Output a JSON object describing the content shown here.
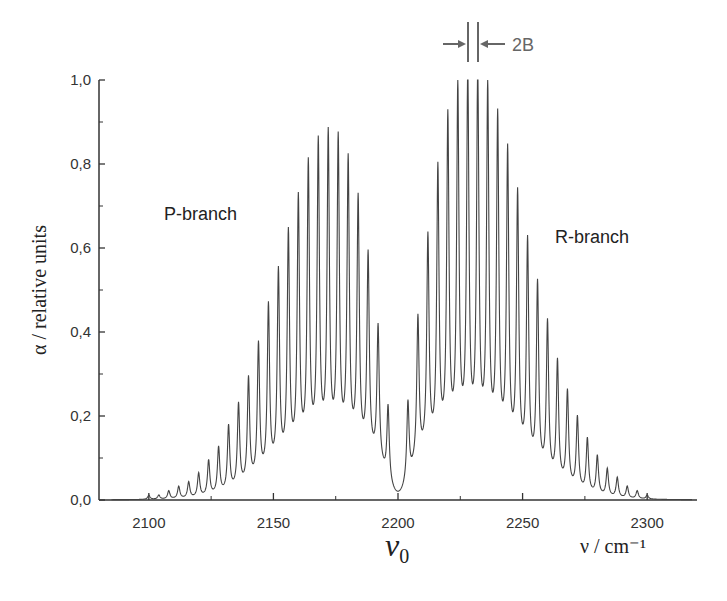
{
  "chart_data": {
    "type": "line",
    "title": "",
    "xlabel": "ν / cm⁻¹",
    "ylabel": "α / relative units",
    "xlim": [
      2080,
      2320
    ],
    "ylim": [
      0,
      1.0
    ],
    "x_ticks": [
      2100,
      2150,
      2200,
      2250,
      2300
    ],
    "x_tick_labels": [
      "2100",
      "2150",
      "2200",
      "2250",
      "2300"
    ],
    "y_ticks": [
      0.0,
      0.2,
      0.4,
      0.6,
      0.8,
      1.0
    ],
    "y_tick_labels": [
      "0,0",
      "0,2",
      "0,4",
      "0,6",
      "0,8",
      "1,0"
    ],
    "grid": false,
    "legend": null,
    "annotations": {
      "p_branch": "P-branch",
      "r_branch": "R-branch",
      "spacing_label": "2B",
      "band_origin": "ν",
      "band_origin_sub": "0"
    },
    "band_origin_cm": 2200,
    "line_spacing_cm": 4,
    "series": [
      {
        "name": "P-branch",
        "x": [
          2100,
          2104,
          2108,
          2112,
          2116,
          2120,
          2124,
          2128,
          2132,
          2136,
          2140,
          2144,
          2148,
          2152,
          2156,
          2160,
          2164,
          2168,
          2172,
          2176,
          2180,
          2184,
          2188,
          2192,
          2196
        ],
        "values": [
          0.01,
          0.01,
          0.02,
          0.03,
          0.04,
          0.06,
          0.09,
          0.12,
          0.17,
          0.22,
          0.28,
          0.36,
          0.45,
          0.53,
          0.62,
          0.7,
          0.78,
          0.83,
          0.85,
          0.84,
          0.79,
          0.7,
          0.57,
          0.4,
          0.21
        ]
      },
      {
        "name": "R-branch",
        "x": [
          2204,
          2208,
          2212,
          2216,
          2220,
          2224,
          2228,
          2232,
          2236,
          2240,
          2244,
          2248,
          2252,
          2256,
          2260,
          2264,
          2268,
          2272,
          2276,
          2280,
          2284,
          2288,
          2292,
          2296,
          2300
        ],
        "values": [
          0.22,
          0.42,
          0.61,
          0.77,
          0.89,
          0.96,
          1.0,
          1.0,
          0.96,
          0.89,
          0.81,
          0.71,
          0.6,
          0.5,
          0.41,
          0.32,
          0.25,
          0.19,
          0.14,
          0.1,
          0.07,
          0.05,
          0.03,
          0.02,
          0.01
        ]
      }
    ],
    "envelope": {
      "p_center": 2172,
      "p_height": 0.115,
      "p_width": 28,
      "r_center": 2230,
      "r_height": 0.13,
      "r_width": 30
    }
  }
}
